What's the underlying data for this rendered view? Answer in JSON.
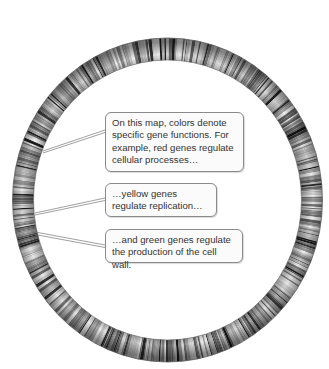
{
  "figure": {
    "callouts": [
      {
        "text": "On this map, colors denote specific gene functions.  For example, red genes regulate cellular processes…"
      },
      {
        "text": "…yellow genes regulate replication…"
      },
      {
        "text": "…and green genes regulate the production of the cell wall."
      }
    ]
  }
}
